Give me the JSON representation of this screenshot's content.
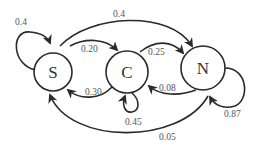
{
  "diagram": {
    "type": "state-transition",
    "nodes": [
      {
        "id": "S",
        "label": "S"
      },
      {
        "id": "C",
        "label": "C"
      },
      {
        "id": "N",
        "label": "N"
      }
    ],
    "edges": [
      {
        "from": "S",
        "to": "S",
        "label": "0.4"
      },
      {
        "from": "S",
        "to": "N",
        "label": "0.4"
      },
      {
        "from": "S",
        "to": "C",
        "label": "0.20"
      },
      {
        "from": "C",
        "to": "N",
        "label": "0.25"
      },
      {
        "from": "C",
        "to": "S",
        "label": "0.30"
      },
      {
        "from": "C",
        "to": "C",
        "label": "0.45"
      },
      {
        "from": "N",
        "to": "C",
        "label": "0.08"
      },
      {
        "from": "N",
        "to": "N",
        "label": "0.87"
      },
      {
        "from": "N",
        "to": "S",
        "label": "0.05"
      }
    ]
  },
  "colors": {
    "stroke": "#2a2a2a",
    "node_text": "#333333",
    "edge_text": "#555555",
    "background": "#ffffff"
  }
}
